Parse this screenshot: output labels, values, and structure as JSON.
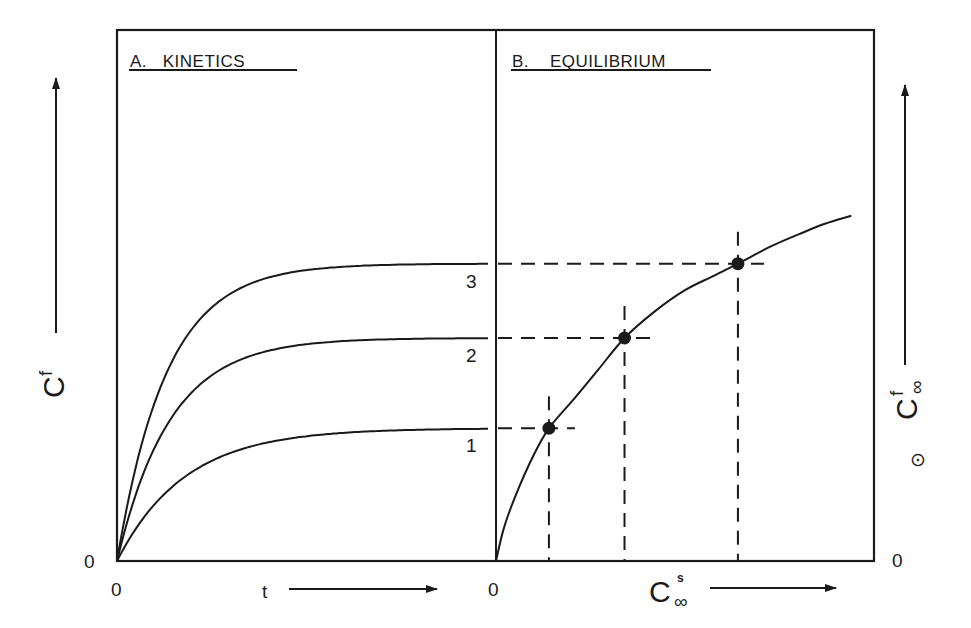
{
  "chart_data": [
    {
      "panel": "A",
      "type": "line",
      "title": "A.   KINETICS",
      "xlabel": "t",
      "ylabel": "C^f",
      "ylabel_base": "C",
      "ylabel_sup": "f",
      "x_origin_label": "0",
      "y_origin_label": "0",
      "xlim": [
        0,
        1
      ],
      "ylim": [
        0,
        1
      ],
      "grid": false,
      "units": "normalized (schematic, no tick values)",
      "series": [
        {
          "name": "1",
          "label": "1",
          "plateau": 0.25,
          "rate": 5.5
        },
        {
          "name": "2",
          "label": "2",
          "plateau": 0.42,
          "rate": 7.0
        },
        {
          "name": "3",
          "label": "3",
          "plateau": 0.56,
          "rate": 7.5
        }
      ]
    },
    {
      "panel": "B",
      "type": "line",
      "title": "B.    EQUILIBRIUM",
      "xlabel": "C^s_∞",
      "xlabel_base": "C",
      "xlabel_sup": "s",
      "xlabel_sub": "∞",
      "ylabel": "C^f_∞",
      "ylabel_base": "C",
      "ylabel_sup": "f",
      "ylabel_sub": "∞",
      "ylabel_symbol": "⊙",
      "x_origin_label": "0",
      "y_origin_label": "0",
      "xlim": [
        0,
        1
      ],
      "ylim": [
        0,
        1
      ],
      "grid": false,
      "units": "normalized (schematic, no tick values)",
      "curve": {
        "x": [
          0,
          0.02,
          0.05,
          0.1,
          0.14,
          0.2,
          0.27,
          0.34,
          0.42,
          0.5,
          0.57,
          0.64,
          0.72,
          0.8,
          0.87,
          0.94
        ],
        "y": [
          0,
          0.06,
          0.12,
          0.2,
          0.25,
          0.3,
          0.36,
          0.42,
          0.47,
          0.51,
          0.535,
          0.56,
          0.59,
          0.615,
          0.635,
          0.65
        ]
      },
      "points": [
        {
          "name": "1",
          "x": 0.14,
          "y": 0.25
        },
        {
          "name": "2",
          "x": 0.34,
          "y": 0.42
        },
        {
          "name": "3",
          "x": 0.64,
          "y": 0.56
        }
      ],
      "projections": "dashed lines from each equilibrium point to both axes; horizontal dashes connect panel A plateaus to panel B points"
    }
  ]
}
